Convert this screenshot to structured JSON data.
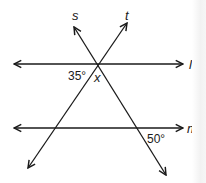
{
  "diagram": {
    "lines": {
      "l": {
        "label": "l",
        "type": "parallel",
        "y": 64
      },
      "m": {
        "label": "m",
        "type": "parallel",
        "y": 128
      },
      "s": {
        "label": "s",
        "type": "transversal"
      },
      "t": {
        "label": "t",
        "type": "transversal"
      }
    },
    "angles": {
      "angle_35": {
        "text": "35°",
        "location": "left of intersection on line l, below l"
      },
      "angle_x": {
        "text": "x",
        "location": "between s and t below line l"
      },
      "angle_50": {
        "text": "50°",
        "location": "right of s at line m, below m"
      }
    },
    "colors": {
      "stroke": "#1a1a1a",
      "background": "#ffffff"
    }
  }
}
